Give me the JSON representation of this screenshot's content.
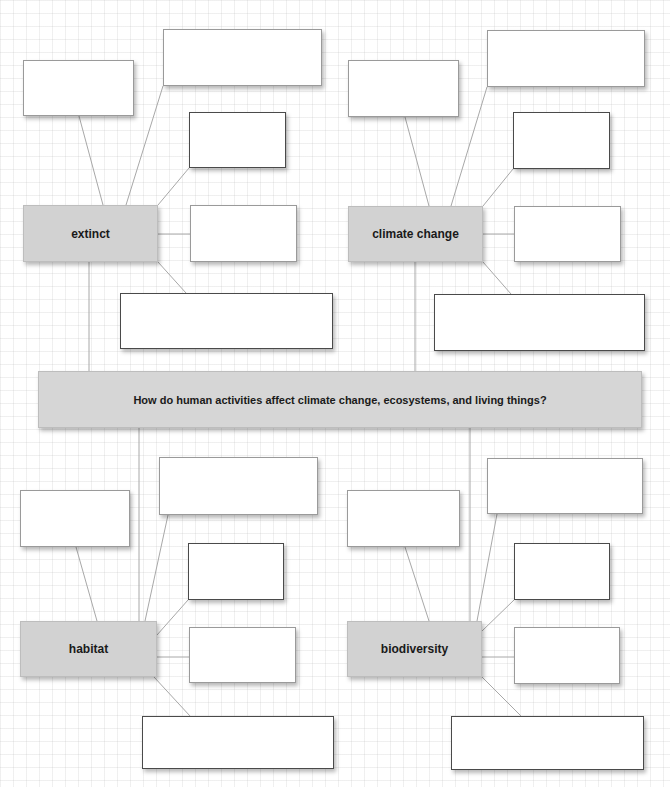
{
  "central_question": "How do human activities affect climate change, ecosystems, and living things?",
  "clusters": [
    {
      "id": "extinct",
      "label": "extinct",
      "blank_boxes": 5
    },
    {
      "id": "climate-change",
      "label": "climate change",
      "blank_boxes": 5
    },
    {
      "id": "habitat",
      "label": "habitat",
      "blank_boxes": 5
    },
    {
      "id": "biodiversity",
      "label": "biodiversity",
      "blank_boxes": 5
    }
  ],
  "colors": {
    "node_fill": "#d2d2d2",
    "box_border": "#9a9a9a",
    "line": "#a8a8a8"
  }
}
